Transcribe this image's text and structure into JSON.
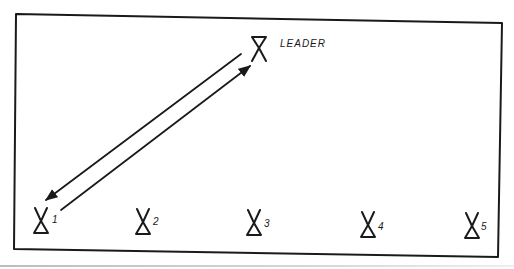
{
  "diagram": {
    "type": "drill-formation",
    "colors": {
      "ink": "#1a1a1a",
      "background": "#ffffff"
    },
    "leader": {
      "label": "LEADER",
      "symbol": "leader-cone-icon"
    },
    "players": [
      {
        "label": "1",
        "symbol": "player-cone-icon"
      },
      {
        "label": "2",
        "symbol": "player-cone-icon"
      },
      {
        "label": "3",
        "symbol": "player-cone-icon"
      },
      {
        "label": "4",
        "symbol": "player-cone-icon"
      },
      {
        "label": "5",
        "symbol": "player-cone-icon"
      }
    ],
    "arrows": [
      {
        "from": "LEADER",
        "to": "1"
      },
      {
        "from": "1",
        "to": "LEADER"
      }
    ]
  }
}
